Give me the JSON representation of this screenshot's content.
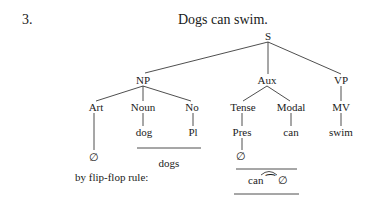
{
  "example_number": "3.",
  "sentence": "Dogs can swim.",
  "tree": {
    "root": "S",
    "level1": [
      "NP",
      "Aux",
      "VP"
    ],
    "np_children": [
      "Art",
      "Noun",
      "No"
    ],
    "aux_children": [
      "Tense",
      "Modal"
    ],
    "vp_children": [
      "MV"
    ],
    "terminals": {
      "noun": "dog",
      "number": "Pl",
      "tense": "Pres",
      "modal": "can",
      "mv": "swim"
    },
    "art_value": "∅",
    "tense_value": "∅"
  },
  "derived": {
    "np_surface": "dogs",
    "flip_flop_label": "by flip-flop rule:",
    "aux_surface": "can ⁀ ∅"
  }
}
